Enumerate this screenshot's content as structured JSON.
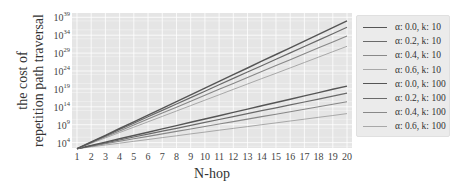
{
  "chart_data": {
    "type": "line",
    "title": "",
    "xlabel": "N-hop",
    "ylabel": "the cost of repetition path traversal",
    "ylabel_lines": [
      "the cost of",
      "repetition path traversal"
    ],
    "yscale": "log",
    "x": [
      1,
      2,
      3,
      4,
      5,
      6,
      7,
      8,
      9,
      10,
      11,
      12,
      13,
      14,
      15,
      16,
      17,
      18,
      19,
      20
    ],
    "x_ticks": [
      "1",
      "2",
      "3",
      "4",
      "5",
      "6",
      "7",
      "8",
      "9",
      "10",
      "11",
      "12",
      "13",
      "14",
      "15",
      "16",
      "17",
      "18",
      "19",
      "20"
    ],
    "y_ticks": [
      {
        "exp": 4,
        "label": "10",
        "sup": "4"
      },
      {
        "exp": 9,
        "label": "10",
        "sup": "9"
      },
      {
        "exp": 14,
        "label": "10",
        "sup": "14"
      },
      {
        "exp": 19,
        "label": "10",
        "sup": "19"
      },
      {
        "exp": 24,
        "label": "10",
        "sup": "24"
      },
      {
        "exp": 29,
        "label": "10",
        "sup": "29"
      },
      {
        "exp": 34,
        "label": "10",
        "sup": "34"
      },
      {
        "exp": 39,
        "label": "10",
        "sup": "39"
      }
    ],
    "ylim_log10": [
      2.5,
      40.2
    ],
    "xlim": [
      0.65,
      20.35
    ],
    "grid": true,
    "legend_position": "right outside",
    "series": [
      {
        "name": "α: 0.0, k: 10",
        "log10_start": 2.3,
        "log10_end": 38.0,
        "color": "#555555",
        "width": 1.4
      },
      {
        "name": "α: 0.2, k: 10",
        "log10_start": 2.3,
        "log10_end": 36.2,
        "color": "#6a6a6a",
        "width": 1.2
      },
      {
        "name": "α: 0.4, k: 10",
        "log10_start": 2.3,
        "log10_end": 33.8,
        "color": "#888888",
        "width": 1.1
      },
      {
        "name": "α: 0.6, k: 10",
        "log10_start": 2.3,
        "log10_end": 30.9,
        "color": "#a8a8a8",
        "width": 1.0
      },
      {
        "name": "α: 0.0, k: 100",
        "log10_start": 2.3,
        "log10_end": 19.8,
        "color": "#555555",
        "width": 1.4
      },
      {
        "name": "α: 0.2, k: 100",
        "log10_start": 2.3,
        "log10_end": 17.8,
        "color": "#6a6a6a",
        "width": 1.2
      },
      {
        "name": "α: 0.4, k: 100",
        "log10_start": 2.3,
        "log10_end": 15.4,
        "color": "#888888",
        "width": 1.1
      },
      {
        "name": "α: 0.6, k: 100",
        "log10_start": 2.3,
        "log10_end": 12.1,
        "color": "#a8a8a8",
        "width": 1.0
      }
    ]
  },
  "colors": {
    "plot_background": "#e5e5e5",
    "grid": "#ffffff",
    "legend_background": "#ebebeb"
  }
}
